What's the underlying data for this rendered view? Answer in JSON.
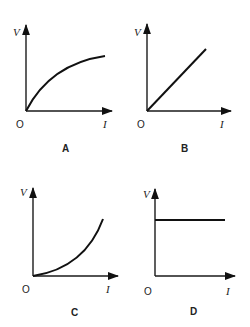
{
  "figure": {
    "graphs": [
      {
        "id": "A",
        "caption": "A",
        "y_label": "V",
        "x_label": "I",
        "origin_label": "O",
        "shape": "concave-down curve through origin"
      },
      {
        "id": "B",
        "caption": "B",
        "y_label": "V",
        "x_label": "I",
        "origin_label": "O",
        "shape": "straight line through origin"
      },
      {
        "id": "C",
        "caption": "C",
        "y_label": "V",
        "x_label": "I",
        "origin_label": "O",
        "shape": "concave-up curve through origin"
      },
      {
        "id": "D",
        "caption": "D",
        "y_label": "V",
        "x_label": "I",
        "origin_label": "O",
        "shape": "horizontal line (constant V)"
      }
    ]
  },
  "colors": {
    "ink": "#111111",
    "background": "#ffffff"
  }
}
